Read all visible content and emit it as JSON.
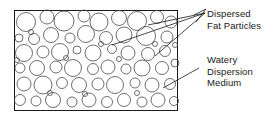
{
  "figure": {
    "name": "emulsion-microstructure-diagram",
    "colors": {
      "background": "#ffffff",
      "border": "#1a1a1a",
      "particle_stroke": "#4a4a4a",
      "text": "#1a1a1a",
      "leader": "#1a1a1a"
    },
    "frame": {
      "x": 14,
      "y": 10,
      "width": 164,
      "height": 101
    }
  },
  "callouts": [
    {
      "id": "dispersed-fat-particles",
      "lines": [
        "Dispersed",
        "Fat Particles"
      ],
      "anchor": {
        "x": 205,
        "y": 13
      },
      "targets": [
        {
          "x": 148,
          "y": 25
        },
        {
          "x": 112,
          "y": 45
        },
        {
          "x": 155,
          "y": 56
        }
      ]
    },
    {
      "id": "watery-dispersion-medium",
      "lines": [
        "Watery",
        "Dispersion",
        "Medium"
      ],
      "anchor": {
        "x": 199,
        "y": 68
      },
      "targets": [
        {
          "x": 163,
          "y": 88
        }
      ]
    }
  ],
  "particles": [
    {
      "cx": 26,
      "cy": 22,
      "r": 9.5
    },
    {
      "cx": 47,
      "cy": 17,
      "r": 7.0
    },
    {
      "cx": 64,
      "cy": 21,
      "r": 10.0
    },
    {
      "cx": 84,
      "cy": 16,
      "r": 6.0
    },
    {
      "cx": 99,
      "cy": 22,
      "r": 9.0
    },
    {
      "cx": 119,
      "cy": 18,
      "r": 7.5
    },
    {
      "cx": 137,
      "cy": 21,
      "r": 9.5
    },
    {
      "cx": 157,
      "cy": 17,
      "r": 6.5
    },
    {
      "cx": 171,
      "cy": 22,
      "r": 6.0
    },
    {
      "cx": 19,
      "cy": 38,
      "r": 4.0
    },
    {
      "cx": 34,
      "cy": 39,
      "r": 5.5
    },
    {
      "cx": 51,
      "cy": 35,
      "r": 7.5
    },
    {
      "cx": 70,
      "cy": 38,
      "r": 5.0
    },
    {
      "cx": 86,
      "cy": 34,
      "r": 8.5
    },
    {
      "cx": 106,
      "cy": 38,
      "r": 6.5
    },
    {
      "cx": 124,
      "cy": 35,
      "r": 8.0
    },
    {
      "cx": 146,
      "cy": 36,
      "r": 9.5
    },
    {
      "cx": 167,
      "cy": 37,
      "r": 6.0
    },
    {
      "cx": 24,
      "cy": 53,
      "r": 8.5
    },
    {
      "cx": 43,
      "cy": 52,
      "r": 6.0
    },
    {
      "cx": 60,
      "cy": 52,
      "r": 8.5
    },
    {
      "cx": 77,
      "cy": 50,
      "r": 4.0
    },
    {
      "cx": 93,
      "cy": 53,
      "r": 8.0
    },
    {
      "cx": 112,
      "cy": 49,
      "r": 4.5
    },
    {
      "cx": 128,
      "cy": 53,
      "r": 7.0
    },
    {
      "cx": 148,
      "cy": 54,
      "r": 6.5
    },
    {
      "cx": 165,
      "cy": 51,
      "r": 5.5
    },
    {
      "cx": 20,
      "cy": 68,
      "r": 5.0
    },
    {
      "cx": 37,
      "cy": 68,
      "r": 7.5
    },
    {
      "cx": 56,
      "cy": 67,
      "r": 6.0
    },
    {
      "cx": 73,
      "cy": 68,
      "r": 8.5
    },
    {
      "cx": 93,
      "cy": 69,
      "r": 5.5
    },
    {
      "cx": 108,
      "cy": 67,
      "r": 7.0
    },
    {
      "cx": 126,
      "cy": 69,
      "r": 5.0
    },
    {
      "cx": 142,
      "cy": 68,
      "r": 8.0
    },
    {
      "cx": 162,
      "cy": 68,
      "r": 6.5
    },
    {
      "cx": 175,
      "cy": 63,
      "r": 4.0
    },
    {
      "cx": 24,
      "cy": 84,
      "r": 7.0
    },
    {
      "cx": 43,
      "cy": 85,
      "r": 9.0
    },
    {
      "cx": 62,
      "cy": 83,
      "r": 5.5
    },
    {
      "cx": 79,
      "cy": 85,
      "r": 7.5
    },
    {
      "cx": 98,
      "cy": 84,
      "r": 6.0
    },
    {
      "cx": 115,
      "cy": 85,
      "r": 8.5
    },
    {
      "cx": 135,
      "cy": 83,
      "r": 5.0
    },
    {
      "cx": 152,
      "cy": 85,
      "r": 7.0
    },
    {
      "cx": 170,
      "cy": 84,
      "r": 5.5
    },
    {
      "cx": 20,
      "cy": 100,
      "r": 5.5
    },
    {
      "cx": 36,
      "cy": 101,
      "r": 5.0
    },
    {
      "cx": 53,
      "cy": 100,
      "r": 7.5
    },
    {
      "cx": 72,
      "cy": 102,
      "r": 5.0
    },
    {
      "cx": 89,
      "cy": 100,
      "r": 7.0
    },
    {
      "cx": 107,
      "cy": 102,
      "r": 5.5
    },
    {
      "cx": 124,
      "cy": 100,
      "r": 6.5
    },
    {
      "cx": 142,
      "cy": 102,
      "r": 5.0
    },
    {
      "cx": 158,
      "cy": 100,
      "r": 7.0
    },
    {
      "cx": 174,
      "cy": 101,
      "r": 4.5
    },
    {
      "cx": 31,
      "cy": 32,
      "r": 2.5
    },
    {
      "cx": 119,
      "cy": 59,
      "r": 2.5
    },
    {
      "cx": 50,
      "cy": 93,
      "r": 2.5
    },
    {
      "cx": 155,
      "cy": 44,
      "r": 2.5
    },
    {
      "cx": 66,
      "cy": 58,
      "r": 2.5
    },
    {
      "cx": 101,
      "cy": 44,
      "r": 2.5
    },
    {
      "cx": 175,
      "cy": 45,
      "r": 2.5
    },
    {
      "cx": 17,
      "cy": 60,
      "r": 2.5
    },
    {
      "cx": 85,
      "cy": 94,
      "r": 2.5
    },
    {
      "cx": 137,
      "cy": 93,
      "r": 2.5
    }
  ]
}
